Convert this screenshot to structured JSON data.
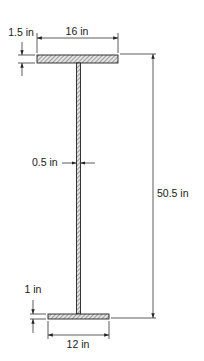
{
  "diagram": {
    "type": "i-beam-cross-section",
    "colors": {
      "stroke": "#222222",
      "hatch": "#555555",
      "fill": "#d8d8d8",
      "background": "#ffffff"
    },
    "top_flange": {
      "width_label": "16 in",
      "thickness_label": "1.5 in"
    },
    "web": {
      "thickness_label": "0.5 in"
    },
    "bottom_flange": {
      "width_label": "12 in",
      "thickness_label": "1 in"
    },
    "overall_height_label": "50.5 in"
  }
}
